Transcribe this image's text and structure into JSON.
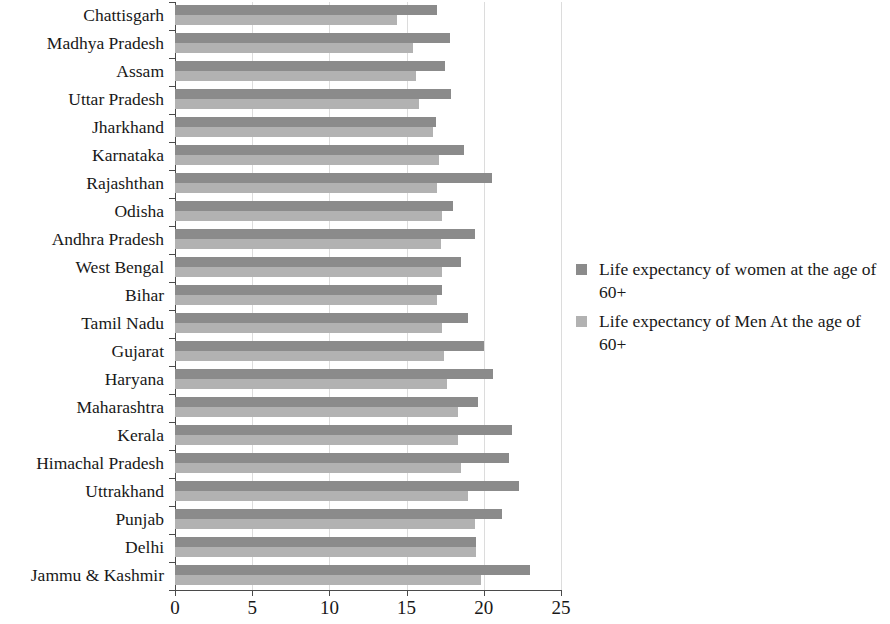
{
  "chart_data": {
    "type": "bar",
    "orientation": "horizontal",
    "title": "",
    "xlabel": "",
    "ylabel": "",
    "xlim": [
      0,
      25
    ],
    "xticks": [
      0,
      5,
      10,
      15,
      20,
      25
    ],
    "xtick_labels": [
      "0",
      "5",
      "10",
      "15",
      "20",
      "25"
    ],
    "grid": "vertical",
    "legend_position": "right",
    "categories": [
      "Chattisgarh",
      "Madhya Pradesh",
      "Assam",
      "Uttar Pradesh",
      "Jharkhand",
      "Karnataka",
      "Rajashthan",
      "Odisha",
      "Andhra Pradesh",
      "West Bengal",
      "Bihar",
      "Tamil Nadu",
      "Gujarat",
      "Haryana",
      "Maharashtra",
      "Kerala",
      "Himachal Pradesh",
      "Uttrakhand",
      "Punjab",
      "Delhi",
      "Jammu & Kashmir"
    ],
    "series": [
      {
        "name": "Life expectancy of women at the age of 60+",
        "color": "#8b8b8b",
        "values": [
          17.0,
          17.8,
          17.5,
          17.9,
          16.9,
          18.7,
          20.5,
          18.0,
          19.4,
          18.5,
          17.3,
          19.0,
          20.0,
          20.6,
          19.6,
          21.8,
          21.6,
          22.3,
          21.2,
          19.5,
          23.0
        ]
      },
      {
        "name": "Life expectancy of Men At the age of 60+",
        "color": "#b2b2b2",
        "values": [
          14.4,
          15.4,
          15.6,
          15.8,
          16.7,
          17.1,
          17.0,
          17.3,
          17.2,
          17.3,
          17.0,
          17.3,
          17.4,
          17.6,
          18.3,
          18.3,
          18.5,
          19.0,
          19.4,
          19.5,
          19.8
        ]
      }
    ]
  },
  "legend": {
    "entries": [
      {
        "label": "Life expectancy of women at the age of 60+",
        "swatch": "women"
      },
      {
        "label": "Life expectancy of Men At the age of 60+",
        "swatch": "men"
      }
    ]
  }
}
